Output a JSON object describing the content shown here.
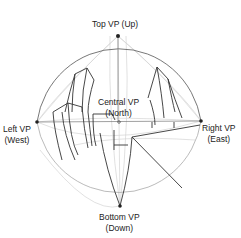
{
  "diagram": {
    "type": "five-point curvilinear perspective",
    "labels": {
      "top": {
        "line1": "Top VP (Up)"
      },
      "central": {
        "line1": "Central VP",
        "line2": "(North)"
      },
      "left": {
        "line1": "Left VP",
        "line2": "(West)"
      },
      "right": {
        "line1": "Right VP",
        "line2": "(East)"
      },
      "bottom": {
        "line1": "Bottom VP",
        "line2": "(Down)"
      }
    },
    "colors": {
      "circle": "#555555",
      "guide": "#cccccc",
      "ink": "#222222",
      "dot": "#222222"
    }
  }
}
